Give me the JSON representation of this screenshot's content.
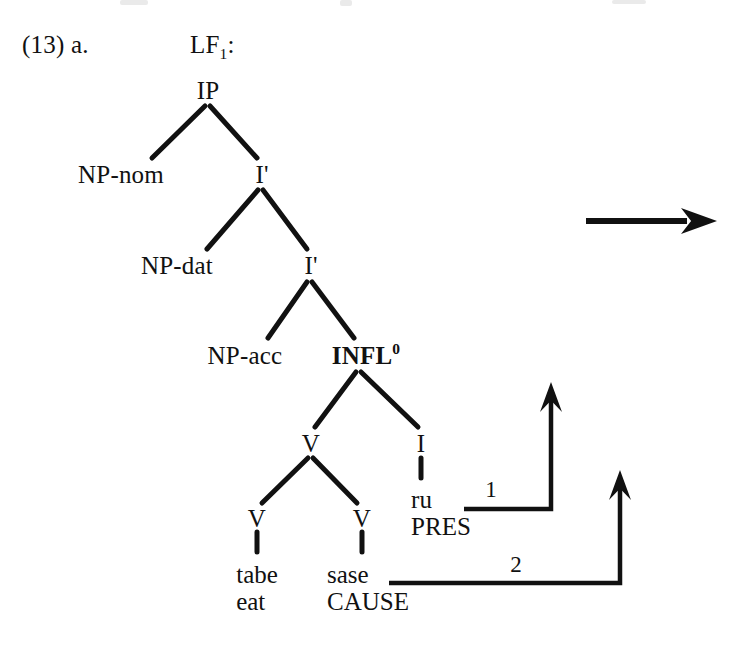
{
  "figure": {
    "example_number": "(13) a.",
    "structure_label": "LF",
    "structure_label_sub": "1",
    "structure_label_colon": ":"
  },
  "tree": {
    "nodes": [
      {
        "id": "ip",
        "label": "IP",
        "x": 208,
        "y": 90,
        "bold": false
      },
      {
        "id": "np-nom",
        "label": "NP-nom",
        "x": 121,
        "y": 174,
        "bold": false
      },
      {
        "id": "i-bar-1",
        "label": "I'",
        "x": 262,
        "y": 174,
        "bold": false
      },
      {
        "id": "np-dat",
        "label": "NP-dat",
        "x": 177,
        "y": 265,
        "bold": false
      },
      {
        "id": "i-bar-2",
        "label": "I'",
        "x": 311,
        "y": 265,
        "bold": false
      },
      {
        "id": "np-acc",
        "label": "NP-acc",
        "x": 245,
        "y": 355,
        "bold": false
      },
      {
        "id": "v-mid",
        "label": "V",
        "x": 311,
        "y": 443,
        "bold": false
      },
      {
        "id": "i-head",
        "label": "I",
        "x": 421,
        "y": 443,
        "bold": false
      },
      {
        "id": "v-left",
        "label": "V",
        "x": 257,
        "y": 518,
        "bold": false
      },
      {
        "id": "v-right",
        "label": "V",
        "x": 362,
        "y": 518,
        "bold": false
      }
    ],
    "infl": {
      "id": "infl-0",
      "label": "INFL",
      "superscript": "0",
      "x": 366,
      "y": 355,
      "bold": true
    },
    "terminals": [
      {
        "id": "tabe",
        "form": "tabe",
        "gloss": "eat",
        "x": 257,
        "y": 562
      },
      {
        "id": "sase",
        "form": "sase",
        "gloss": "CAUSE",
        "x": 368,
        "y": 562
      },
      {
        "id": "ru",
        "form": "ru",
        "gloss": "PRES",
        "x": 441,
        "y": 487
      }
    ],
    "branches": [
      {
        "from": "ip",
        "to": "np-nom",
        "x1": 205,
        "y1": 106,
        "x2": 152,
        "y2": 158
      },
      {
        "from": "ip",
        "to": "i-bar-1",
        "x1": 210,
        "y1": 106,
        "x2": 257,
        "y2": 158
      },
      {
        "from": "i-bar-1",
        "to": "np-dat",
        "x1": 258,
        "y1": 190,
        "x2": 207,
        "y2": 249
      },
      {
        "from": "i-bar-1",
        "to": "i-bar-2",
        "x1": 263,
        "y1": 190,
        "x2": 307,
        "y2": 249
      },
      {
        "from": "i-bar-2",
        "to": "np-acc",
        "x1": 307,
        "y1": 282,
        "x2": 268,
        "y2": 338
      },
      {
        "from": "i-bar-2",
        "to": "infl-0",
        "x1": 312,
        "y1": 282,
        "x2": 354,
        "y2": 338
      },
      {
        "from": "infl-0",
        "to": "v-mid",
        "x1": 356,
        "y1": 372,
        "x2": 315,
        "y2": 427
      },
      {
        "from": "infl-0",
        "to": "i-head",
        "x1": 361,
        "y1": 372,
        "x2": 418,
        "y2": 427
      },
      {
        "from": "v-mid",
        "to": "v-left",
        "x1": 308,
        "y1": 458,
        "x2": 262,
        "y2": 503
      },
      {
        "from": "v-mid",
        "to": "v-right",
        "x1": 313,
        "y1": 458,
        "x2": 357,
        "y2": 503
      },
      {
        "from": "i-head",
        "to": "ru",
        "x1": 421,
        "y1": 458,
        "x2": 421,
        "y2": 478
      },
      {
        "from": "v-left",
        "to": "tabe",
        "x1": 257,
        "y1": 532,
        "x2": 257,
        "y2": 552
      },
      {
        "from": "v-right",
        "to": "sase",
        "x1": 362,
        "y1": 532,
        "x2": 362,
        "y2": 552
      }
    ]
  },
  "movement_arrows": [
    {
      "id": "movement-1",
      "label": "1",
      "label_x": 491,
      "label_y": 489,
      "start_x": 464,
      "corner_x": 551,
      "horizontal_y": 509,
      "tip_y": 382
    },
    {
      "id": "movement-2",
      "label": "2",
      "label_x": 516,
      "label_y": 564,
      "start_x": 389,
      "corner_x": 620,
      "horizontal_y": 583,
      "tip_y": 470
    }
  ],
  "derivation_arrow": {
    "id": "derivation-arrow",
    "x1": 586,
    "x2": 717,
    "y": 221
  }
}
